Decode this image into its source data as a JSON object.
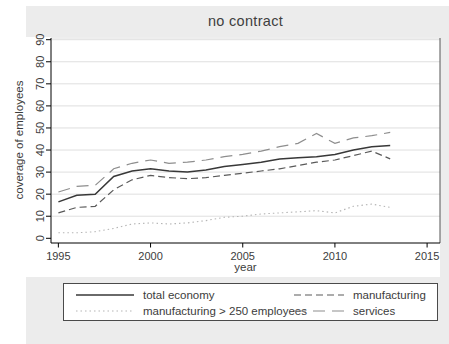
{
  "title": "no contract",
  "colors": {
    "figure_bg": "#ececec",
    "plot_bg": "#ffffff",
    "grid": "#dfdfdf",
    "axis": "#000000",
    "plot_border_right": "#555555",
    "plot_border_top": "#dddddd",
    "text": "#3c3c3c"
  },
  "chart_data": {
    "type": "line",
    "title": "no contract",
    "xlabel": "year",
    "ylabel": "coverage of employees",
    "xlim": [
      1994.6,
      2015.7
    ],
    "ylim": [
      0,
      90
    ],
    "x_ticks": [
      1995,
      2000,
      2005,
      2010,
      2015
    ],
    "y_ticks": [
      0,
      10,
      20,
      30,
      40,
      50,
      60,
      70,
      80,
      90
    ],
    "grid": "horizontal",
    "legend_position": "bottom",
    "x": [
      1995,
      1996,
      1997,
      1998,
      1999,
      2000,
      2001,
      2002,
      2003,
      2004,
      2005,
      2006,
      2007,
      2008,
      2009,
      2010,
      2011,
      2012,
      2013
    ],
    "series": [
      {
        "name": "total economy",
        "color": "#383838",
        "dash": "",
        "width": 1.5,
        "values": [
          16.5,
          19.5,
          20,
          28,
          30.5,
          31.5,
          30.5,
          30,
          31,
          32.5,
          33.5,
          34.5,
          36,
          36.5,
          37,
          38,
          40,
          41.5,
          42
        ]
      },
      {
        "name": "manufacturing",
        "color": "#5a5a5a",
        "dash": "7 4",
        "width": 1.2,
        "values": [
          11.5,
          14,
          14.5,
          22,
          26.5,
          28.5,
          27.5,
          27,
          27.5,
          28.5,
          29.5,
          30.5,
          31.5,
          33,
          34.5,
          35.5,
          37.5,
          39.5,
          36
        ]
      },
      {
        "name": "manufacturing > 250 employees",
        "color": "#b5b5b5",
        "dash": "1.5 3",
        "width": 1.1,
        "values": [
          2.5,
          2.5,
          3,
          4.5,
          6.5,
          7,
          6.5,
          7,
          8,
          9.5,
          10,
          11,
          11.5,
          12,
          12.5,
          11.5,
          14.5,
          15.5,
          14
        ]
      },
      {
        "name": "services",
        "color": "#8e8e8e",
        "dash": "12 7",
        "width": 1.2,
        "values": [
          21,
          23.5,
          24,
          31.5,
          34,
          35.5,
          34,
          34.5,
          35.5,
          37,
          38,
          39.5,
          41.5,
          43,
          47.5,
          43,
          45.5,
          46.5,
          48
        ]
      }
    ]
  }
}
